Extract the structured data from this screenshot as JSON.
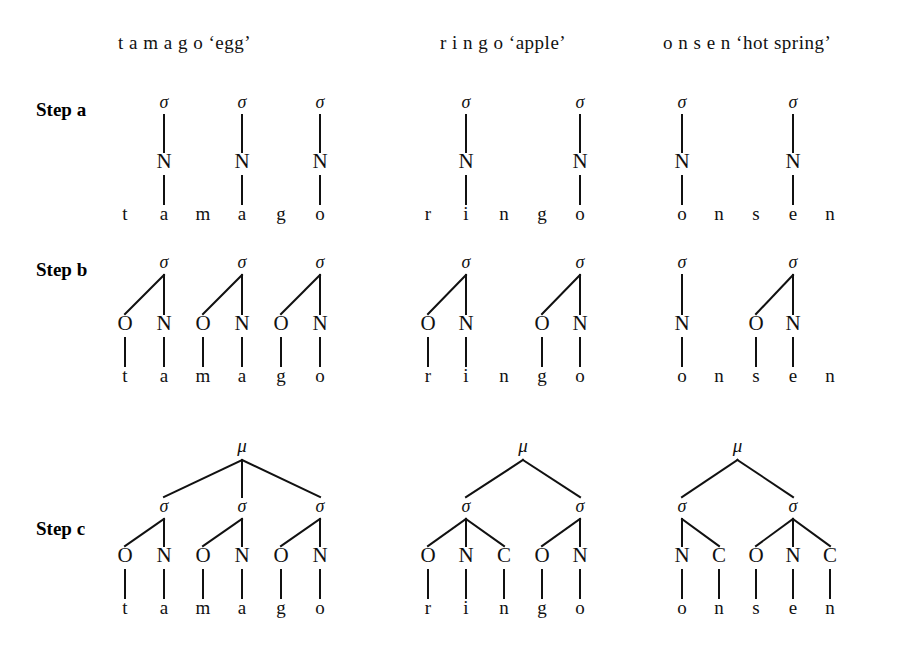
{
  "figure": {
    "background": "#ffffff",
    "ink": "#111111"
  },
  "columns": [
    {
      "id": "tamago",
      "word": "t a m a g o",
      "gloss": "‘egg’",
      "header": "t a m a g o ‘egg’",
      "header_x": 118,
      "header_y": 32
    },
    {
      "id": "ringo",
      "word": "r i n g o",
      "gloss": "‘apple’",
      "header": "r i n g o ‘apple’",
      "header_x": 440,
      "header_y": 32
    },
    {
      "id": "onsen",
      "word": "o n s e n",
      "gloss": "‘hot spring’",
      "header": "o n s e n ‘hot spring’",
      "header_x": 663,
      "header_y": 32
    }
  ],
  "steps": [
    {
      "id": "step_a",
      "label": "Step a",
      "label_x": 36,
      "label_y": 99
    },
    {
      "id": "step_b",
      "label": "Step b",
      "label_x": 36,
      "label_y": 259
    },
    {
      "id": "step_c",
      "label": "Step c",
      "label_x": 36,
      "label_y": 518
    }
  ],
  "glyphs": {
    "sigma": "σ",
    "mu": "μ",
    "onset": "O",
    "nucleus": "N",
    "coda": "C"
  },
  "chart_data": {
    "type": "diagram",
    "rows": [
      "Step a",
      "Step b",
      "Step c"
    ],
    "columns": [
      "tamago ‘egg’",
      "ringo ‘apple’",
      "onsen ‘hot spring’"
    ],
    "trees": {
      "step_a": {
        "tamago": {
          "segments": [
            "t",
            "a",
            "m",
            "a",
            "g",
            "o"
          ],
          "syllables": [
            {
              "sigma": true,
              "constituents": [
                {
                  "type": "N",
                  "segment": "a",
                  "index": 1
                }
              ]
            },
            {
              "sigma": true,
              "constituents": [
                {
                  "type": "N",
                  "segment": "a",
                  "index": 3
                }
              ]
            },
            {
              "sigma": true,
              "constituents": [
                {
                  "type": "N",
                  "segment": "o",
                  "index": 5
                }
              ]
            }
          ],
          "mu": false
        },
        "ringo": {
          "segments": [
            "r",
            "i",
            "n",
            "g",
            "o"
          ],
          "syllables": [
            {
              "sigma": true,
              "constituents": [
                {
                  "type": "N",
                  "segment": "i",
                  "index": 1
                }
              ]
            },
            {
              "sigma": true,
              "constituents": [
                {
                  "type": "N",
                  "segment": "o",
                  "index": 4
                }
              ]
            }
          ],
          "mu": false
        },
        "onsen": {
          "segments": [
            "o",
            "n",
            "s",
            "e",
            "n"
          ],
          "syllables": [
            {
              "sigma": true,
              "constituents": [
                {
                  "type": "N",
                  "segment": "o",
                  "index": 0
                }
              ]
            },
            {
              "sigma": true,
              "constituents": [
                {
                  "type": "N",
                  "segment": "e",
                  "index": 3
                }
              ]
            }
          ],
          "mu": false
        }
      },
      "step_b": {
        "tamago": {
          "segments": [
            "t",
            "a",
            "m",
            "a",
            "g",
            "o"
          ],
          "syllables": [
            {
              "sigma": true,
              "constituents": [
                {
                  "type": "O",
                  "segment": "t",
                  "index": 0
                },
                {
                  "type": "N",
                  "segment": "a",
                  "index": 1
                }
              ]
            },
            {
              "sigma": true,
              "constituents": [
                {
                  "type": "O",
                  "segment": "m",
                  "index": 2
                },
                {
                  "type": "N",
                  "segment": "a",
                  "index": 3
                }
              ]
            },
            {
              "sigma": true,
              "constituents": [
                {
                  "type": "O",
                  "segment": "g",
                  "index": 4
                },
                {
                  "type": "N",
                  "segment": "o",
                  "index": 5
                }
              ]
            }
          ],
          "mu": false
        },
        "ringo": {
          "segments": [
            "r",
            "i",
            "n",
            "g",
            "o"
          ],
          "syllables": [
            {
              "sigma": true,
              "constituents": [
                {
                  "type": "O",
                  "segment": "r",
                  "index": 0
                },
                {
                  "type": "N",
                  "segment": "i",
                  "index": 1
                }
              ]
            },
            {
              "sigma": true,
              "constituents": [
                {
                  "type": "O",
                  "segment": "g",
                  "index": 3
                },
                {
                  "type": "N",
                  "segment": "o",
                  "index": 4
                }
              ]
            }
          ],
          "unparsed": [
            "n"
          ],
          "mu": false
        },
        "onsen": {
          "segments": [
            "o",
            "n",
            "s",
            "e",
            "n"
          ],
          "syllables": [
            {
              "sigma": true,
              "constituents": [
                {
                  "type": "N",
                  "segment": "o",
                  "index": 0
                }
              ]
            },
            {
              "sigma": true,
              "constituents": [
                {
                  "type": "O",
                  "segment": "s",
                  "index": 2
                },
                {
                  "type": "N",
                  "segment": "e",
                  "index": 3
                }
              ]
            }
          ],
          "unparsed": [
            "n",
            "n"
          ],
          "mu": false
        }
      },
      "step_c": {
        "tamago": {
          "segments": [
            "t",
            "a",
            "m",
            "a",
            "g",
            "o"
          ],
          "syllables": [
            {
              "sigma": true,
              "constituents": [
                {
                  "type": "O",
                  "segment": "t",
                  "index": 0
                },
                {
                  "type": "N",
                  "segment": "a",
                  "index": 1
                }
              ]
            },
            {
              "sigma": true,
              "constituents": [
                {
                  "type": "O",
                  "segment": "m",
                  "index": 2
                },
                {
                  "type": "N",
                  "segment": "a",
                  "index": 3
                }
              ]
            },
            {
              "sigma": true,
              "constituents": [
                {
                  "type": "O",
                  "segment": "g",
                  "index": 4
                },
                {
                  "type": "N",
                  "segment": "o",
                  "index": 5
                }
              ]
            }
          ],
          "mu": true
        },
        "ringo": {
          "segments": [
            "r",
            "i",
            "n",
            "g",
            "o"
          ],
          "syllables": [
            {
              "sigma": true,
              "constituents": [
                {
                  "type": "O",
                  "segment": "r",
                  "index": 0
                },
                {
                  "type": "N",
                  "segment": "i",
                  "index": 1
                },
                {
                  "type": "C",
                  "segment": "n",
                  "index": 2
                }
              ]
            },
            {
              "sigma": true,
              "constituents": [
                {
                  "type": "O",
                  "segment": "g",
                  "index": 3
                },
                {
                  "type": "N",
                  "segment": "o",
                  "index": 4
                }
              ]
            }
          ],
          "mu": true
        },
        "onsen": {
          "segments": [
            "o",
            "n",
            "s",
            "e",
            "n"
          ],
          "syllables": [
            {
              "sigma": true,
              "constituents": [
                {
                  "type": "N",
                  "segment": "o",
                  "index": 0
                },
                {
                  "type": "C",
                  "segment": "n",
                  "index": 1
                }
              ]
            },
            {
              "sigma": true,
              "constituents": [
                {
                  "type": "O",
                  "segment": "s",
                  "index": 2
                },
                {
                  "type": "N",
                  "segment": "e",
                  "index": 3
                },
                {
                  "type": "C",
                  "segment": "n",
                  "index": 4
                }
              ]
            }
          ],
          "mu": true
        }
      }
    }
  },
  "layout": {
    "step_a": {
      "y_sigma": 108,
      "y_tier": 168,
      "y_seg": 220
    },
    "step_b": {
      "y_sigma": 268,
      "y_tier": 330,
      "y_seg": 382
    },
    "step_c": {
      "y_mu": 452,
      "y_sigma": 512,
      "y_tier": 562,
      "y_seg": 614
    },
    "segment_rows": {
      "tamago": {
        "x0": 125,
        "dx": 39
      },
      "ringo": {
        "x0": 428,
        "dx": 38
      },
      "onsen": {
        "x0": 682,
        "dx": 37
      }
    }
  }
}
